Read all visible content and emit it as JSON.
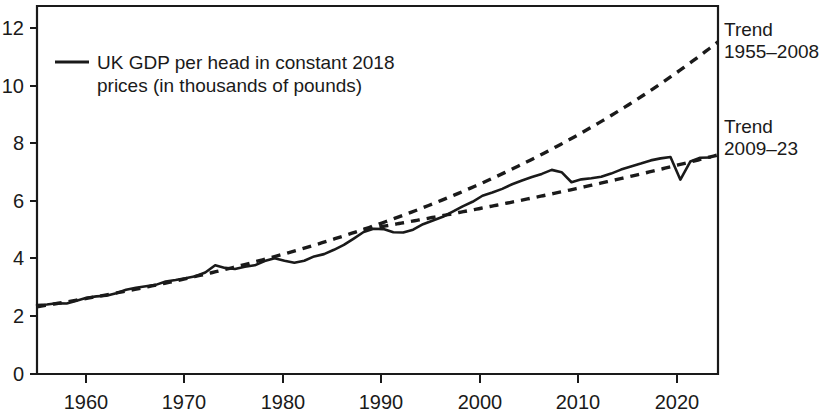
{
  "chart_data": {
    "type": "line",
    "title": "",
    "subtitle": "",
    "xlabel": "",
    "ylabel": "",
    "xlim": [
      1955,
      2023.8
    ],
    "ylim": [
      0,
      12.8
    ],
    "xticks": [
      "1960",
      "1970",
      "1980",
      "1990",
      "2000",
      "2010",
      "2020"
    ],
    "xtick_values": [
      1960,
      1970,
      1980,
      1990,
      2000,
      2010,
      2020
    ],
    "yticks": [
      "0",
      "2",
      "4",
      "6",
      "8",
      "10",
      "12"
    ],
    "ytick_values": [
      0,
      2,
      4,
      6,
      8,
      10,
      12
    ],
    "grid": false,
    "legend_position": "upper-left-inside",
    "units": "thousands of pounds (constant 2018 prices)",
    "series": [
      {
        "name": "UK GDP per head in constant 2018 prices (in thousands of pounds)",
        "style": "solid",
        "color": "#1a1a1a",
        "x": [
          1955,
          1956,
          1957,
          1958,
          1959,
          1960,
          1961,
          1962,
          1963,
          1964,
          1965,
          1966,
          1967,
          1968,
          1969,
          1970,
          1971,
          1972,
          1973,
          1974,
          1975,
          1976,
          1977,
          1978,
          1979,
          1980,
          1981,
          1982,
          1983,
          1984,
          1985,
          1986,
          1987,
          1988,
          1989,
          1990,
          1991,
          1992,
          1993,
          1994,
          1995,
          1996,
          1997,
          1998,
          1999,
          2000,
          2001,
          2002,
          2003,
          2004,
          2005,
          2006,
          2007,
          2008,
          2009,
          2010,
          2011,
          2012,
          2013,
          2014,
          2015,
          2016,
          2017,
          2018,
          2019,
          2020,
          2021,
          2022,
          2023
        ],
        "values": [
          2.4,
          2.42,
          2.46,
          2.45,
          2.55,
          2.65,
          2.7,
          2.72,
          2.81,
          2.93,
          3.0,
          3.05,
          3.1,
          3.22,
          3.27,
          3.33,
          3.4,
          3.53,
          3.78,
          3.69,
          3.65,
          3.73,
          3.78,
          3.93,
          4.03,
          3.94,
          3.87,
          3.94,
          4.09,
          4.17,
          4.32,
          4.49,
          4.71,
          4.94,
          5.05,
          5.04,
          4.93,
          4.92,
          5.02,
          5.21,
          5.34,
          5.47,
          5.65,
          5.83,
          5.99,
          6.2,
          6.31,
          6.44,
          6.6,
          6.73,
          6.85,
          6.96,
          7.1,
          7.02,
          6.67,
          6.77,
          6.81,
          6.86,
          6.97,
          7.11,
          7.22,
          7.32,
          7.43,
          7.5,
          7.55,
          6.76,
          7.39,
          7.52,
          7.53
        ]
      },
      {
        "name": "Trend 1955-2008",
        "style": "dashed",
        "color": "#1a1a1a",
        "x": [
          1955,
          2023.8
        ],
        "values": [
          2.34,
          11.55
        ],
        "growth_type": "exponential"
      },
      {
        "name": "Trend 2009-23",
        "style": "dashed",
        "color": "#1a1a1a",
        "x": [
          1988,
          2023.8
        ],
        "values": [
          5.02,
          7.62
        ],
        "growth_type": "exponential"
      }
    ],
    "annotations": [
      {
        "name": "trend-1955-2008-label",
        "text_line1": "Trend",
        "text_line2": "1955–2008",
        "x_px": 723,
        "y_px": 30
      },
      {
        "name": "trend-2009-23-label",
        "text_line1": "Trend",
        "text_line2": "2009–23",
        "x_px": 723,
        "y_px": 127
      }
    ],
    "legend": {
      "line1": "UK GDP per head in constant 2018",
      "line2": "prices (in thousands of pounds)",
      "swatch": "solid-line-sample"
    }
  }
}
